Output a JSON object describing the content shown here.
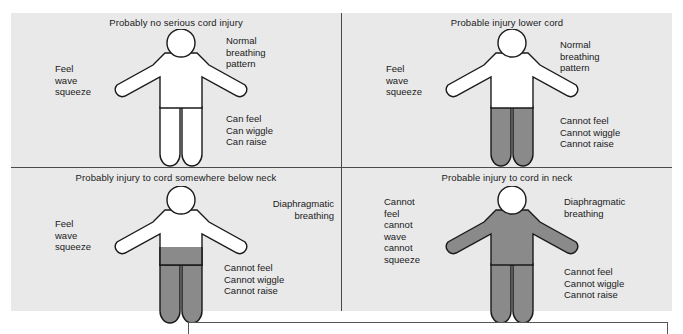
{
  "diagram": {
    "background_color": "#e9e9e9",
    "page_color": "#ffffff",
    "body_outline_color": "#1a1a1a",
    "body_fill_normal": "#ffffff",
    "body_fill_paralyzed": "#8a8a8a",
    "divider_color": "#4a4a4a"
  },
  "quadrants": [
    {
      "id": "no-serious-cord-injury",
      "title": "Probably no serious cord injury",
      "sensory_label": "Feel\nwave\nsqueeze",
      "breathing_label": "Normal\nbreathing\npattern",
      "motor_label": "Can feel\nCan wiggle\nCan raise",
      "shading": "none",
      "shaded_regions": []
    },
    {
      "id": "injury-lower-cord",
      "title": "Probable injury lower cord",
      "sensory_label": "Feel\nwave\nsqueeze",
      "breathing_label": "Normal\nbreathing\npattern",
      "motor_label": "Cannot feel\nCannot wiggle\nCannot raise",
      "shading": "legs",
      "shaded_regions": [
        "legs"
      ]
    },
    {
      "id": "injury-below-neck",
      "title": "Probably injury to cord somewhere below neck",
      "sensory_label": "Feel\nwave\nsqueeze",
      "breathing_label": "Diaphragmatic\nbreathing",
      "motor_label": "Cannot feel\nCannot wiggle\nCannot raise",
      "shading": "lower-torso-and-legs",
      "shaded_regions": [
        "lower-torso",
        "legs"
      ]
    },
    {
      "id": "injury-cord-in-neck",
      "title": "Probable injury to cord in neck",
      "sensory_label": "Cannot\nfeel\ncannot\nwave\ncannot\nsqueeze",
      "breathing_label": "Diaphragmatic\nbreathing",
      "motor_label": "Cannot feel\nCannot wiggle\nCannot raise",
      "shading": "whole-body-except-head",
      "shaded_regions": [
        "arms",
        "torso",
        "legs"
      ]
    }
  ]
}
